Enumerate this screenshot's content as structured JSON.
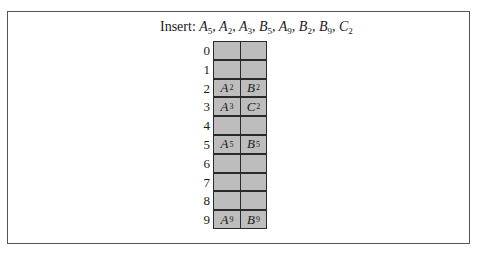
{
  "title": {
    "label": "Insert:",
    "sequence": [
      {
        "letter": "A",
        "sub": "5"
      },
      {
        "letter": "A",
        "sub": "2"
      },
      {
        "letter": "A",
        "sub": "3"
      },
      {
        "letter": "B",
        "sub": "5"
      },
      {
        "letter": "A",
        "sub": "9"
      },
      {
        "letter": "B",
        "sub": "2"
      },
      {
        "letter": "B",
        "sub": "9"
      },
      {
        "letter": "C",
        "sub": "2"
      }
    ]
  },
  "hash_table": {
    "rows": [
      {
        "index": "0",
        "cells": [
          null,
          null
        ]
      },
      {
        "index": "1",
        "cells": [
          null,
          null
        ]
      },
      {
        "index": "2",
        "cells": [
          {
            "letter": "A",
            "sub": "2"
          },
          {
            "letter": "B",
            "sub": "2"
          }
        ]
      },
      {
        "index": "3",
        "cells": [
          {
            "letter": "A",
            "sub": "3"
          },
          {
            "letter": "C",
            "sub": "2"
          }
        ]
      },
      {
        "index": "4",
        "cells": [
          null,
          null
        ]
      },
      {
        "index": "5",
        "cells": [
          {
            "letter": "A",
            "sub": "5"
          },
          {
            "letter": "B",
            "sub": "5"
          }
        ]
      },
      {
        "index": "6",
        "cells": [
          null,
          null
        ]
      },
      {
        "index": "7",
        "cells": [
          null,
          null
        ]
      },
      {
        "index": "8",
        "cells": [
          null,
          null
        ]
      },
      {
        "index": "9",
        "cells": [
          {
            "letter": "A",
            "sub": "9"
          },
          {
            "letter": "B",
            "sub": "9"
          }
        ]
      }
    ]
  },
  "colors": {
    "cell_fill": "#bdbdbd",
    "border": "#2a2a2a",
    "frame": "#555555"
  }
}
